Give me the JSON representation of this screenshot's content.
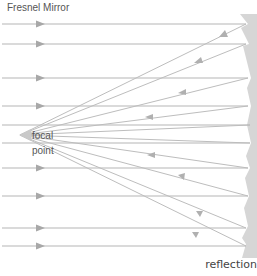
{
  "diagram": {
    "title": "Fresnel Mirror",
    "focal_label_line1": "focal",
    "focal_label_line2": "point",
    "caption": "reflection",
    "colors": {
      "ray": "#b8b8b8",
      "mirror": "#d4d4d4",
      "text": "#555555"
    },
    "incoming_rays_y": [
      24,
      44,
      78,
      106,
      125,
      143,
      168,
      196,
      228,
      246
    ],
    "focal_point": {
      "x": 20,
      "y": 135
    },
    "reflected_rays": [
      {
        "from_y": 24,
        "arrow": "towards-focal"
      },
      {
        "from_y": 44,
        "arrow": "towards-focal"
      },
      {
        "from_y": 78,
        "arrow": "towards-focal"
      },
      {
        "from_y": 106,
        "arrow": "towards-focal"
      },
      {
        "from_y": 125,
        "arrow": "none"
      },
      {
        "from_y": 143,
        "arrow": "towards-focal"
      },
      {
        "from_y": 168,
        "arrow": "towards-focal"
      },
      {
        "from_y": 196,
        "arrow": "towards-focal"
      },
      {
        "from_y": 228,
        "arrow": "towards-focal"
      },
      {
        "from_y": 246,
        "arrow": "towards-focal"
      }
    ]
  }
}
